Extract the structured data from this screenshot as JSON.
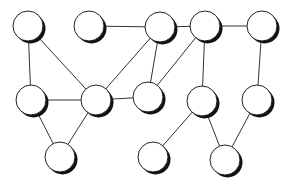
{
  "diagram": {
    "type": "undirected-graph",
    "colors": {
      "background": "#ffffff",
      "node_fill": "#ffffff",
      "node_stroke": "#222222",
      "node_shadow": "#111111",
      "edge": "#333333"
    },
    "nodes": [
      {
        "id": "n1",
        "row": 1,
        "col": 1
      },
      {
        "id": "n2",
        "row": 1,
        "col": 2
      },
      {
        "id": "n3",
        "row": 1,
        "col": 3
      },
      {
        "id": "n4",
        "row": 1,
        "col": 4
      },
      {
        "id": "n5",
        "row": 1,
        "col": 5
      },
      {
        "id": "n6",
        "row": 2,
        "col": 1
      },
      {
        "id": "n7",
        "row": 2,
        "col": 2
      },
      {
        "id": "n8",
        "row": 2,
        "col": 3
      },
      {
        "id": "n9",
        "row": 2,
        "col": 4
      },
      {
        "id": "n10",
        "row": 2,
        "col": 5
      },
      {
        "id": "n11",
        "row": 3,
        "col": 1
      },
      {
        "id": "n12",
        "row": 3,
        "col": 2
      },
      {
        "id": "n13",
        "row": 3,
        "col": 3
      }
    ],
    "edges": [
      [
        "n2",
        "n3"
      ],
      [
        "n3",
        "n4"
      ],
      [
        "n4",
        "n5"
      ],
      [
        "n1",
        "n6"
      ],
      [
        "n1",
        "n7"
      ],
      [
        "n3",
        "n7"
      ],
      [
        "n3",
        "n8"
      ],
      [
        "n4",
        "n8"
      ],
      [
        "n4",
        "n9"
      ],
      [
        "n5",
        "n10"
      ],
      [
        "n6",
        "n7"
      ],
      [
        "n7",
        "n8"
      ],
      [
        "n6",
        "n11"
      ],
      [
        "n7",
        "n11"
      ],
      [
        "n9",
        "n12"
      ],
      [
        "n9",
        "n13"
      ],
      [
        "n10",
        "n13"
      ]
    ]
  }
}
